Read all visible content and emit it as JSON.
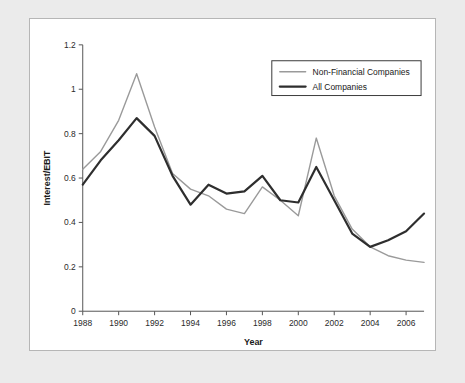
{
  "chart_data": {
    "type": "line",
    "title": "",
    "xlabel": "Year",
    "ylabel": "Interest/EBIT",
    "xlim": [
      1988,
      2007
    ],
    "ylim": [
      0,
      1.2
    ],
    "grid": false,
    "legend_position": "top-right",
    "x": [
      1988,
      1989,
      1990,
      1991,
      1992,
      1993,
      1994,
      1995,
      1996,
      1997,
      1998,
      1999,
      2000,
      2001,
      2002,
      2003,
      2004,
      2005,
      2006,
      2007
    ],
    "xticks": [
      "1988",
      "1990",
      "1992",
      "1994",
      "1996",
      "1998",
      "2000",
      "2002",
      "2004",
      "2006"
    ],
    "xtick_values": [
      1988,
      1990,
      1992,
      1994,
      1996,
      1998,
      2000,
      2002,
      2004,
      2006
    ],
    "yticks": [
      "0",
      "0.2",
      "0.4",
      "0.6",
      "0.8",
      "1",
      "1.2"
    ],
    "ytick_values": [
      0,
      0.2,
      0.4,
      0.6,
      0.8,
      1.0,
      1.2
    ],
    "series": [
      {
        "name": "Non-Financial Companies",
        "color": "#9a9a9a",
        "width": 1.4,
        "values": [
          0.64,
          0.72,
          0.86,
          1.07,
          0.83,
          0.62,
          0.55,
          0.52,
          0.46,
          0.44,
          0.56,
          0.5,
          0.43,
          0.78,
          0.52,
          0.37,
          0.29,
          0.25,
          0.23,
          0.22
        ]
      },
      {
        "name": "All Companies",
        "color": "#2e2e2e",
        "width": 2.2,
        "values": [
          0.57,
          0.68,
          0.77,
          0.87,
          0.79,
          0.61,
          0.48,
          0.57,
          0.53,
          0.54,
          0.61,
          0.5,
          0.49,
          0.65,
          0.5,
          0.35,
          0.29,
          0.32,
          0.36,
          0.44
        ]
      }
    ]
  },
  "legend": {
    "entries": [
      {
        "label": "Non-Financial Companies"
      },
      {
        "label": "All Companies"
      }
    ]
  }
}
